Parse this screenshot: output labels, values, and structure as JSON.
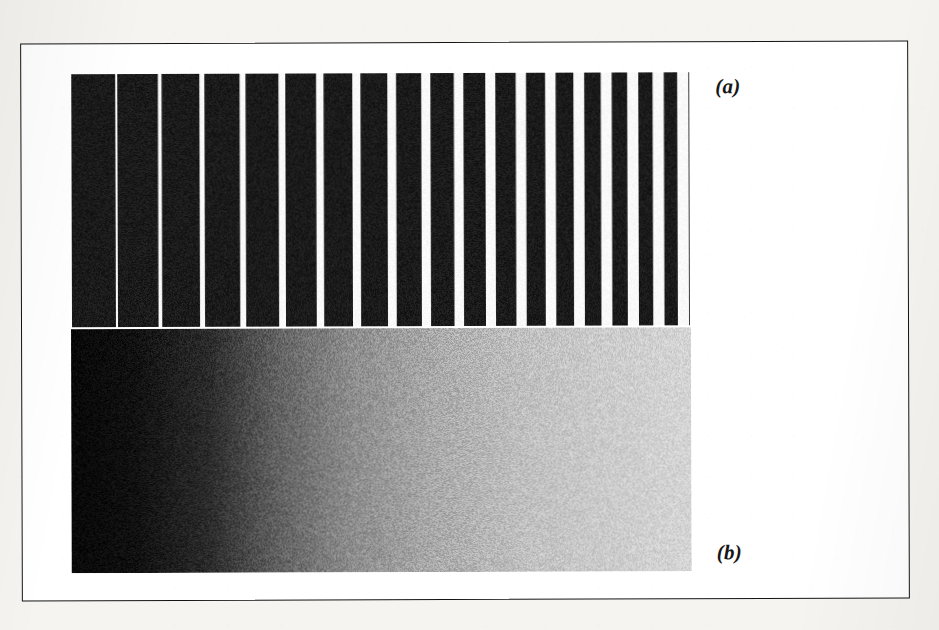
{
  "figure": {
    "caption_labels": {
      "panel_a": "(a)",
      "panel_b": "(b)"
    },
    "frame": {
      "border_color": "#141414",
      "background_color": "#ffffff",
      "page_background_color": "#f5f4f1"
    }
  },
  "chart_data": [
    {
      "id": "panel-a",
      "type": "bar",
      "title": "(a)",
      "subtitle": "Square-wave grating with spatial-frequency chirp",
      "xlabel": "",
      "ylabel": "",
      "grid": false,
      "legend": null,
      "description": "Vertical black bars on white whose spatial period decreases geometrically from left to right; bar duty cycle falls from near 1.0 (solid black) at the left to thin lines at the right.",
      "x_extent_px": [
        0,
        618
      ],
      "bar_color": "#0d0d0d",
      "gap_color": "#ffffff",
      "n_bars": 40,
      "period_start_px": 46.0,
      "period_end_px": 11.0,
      "duty_start": 0.955,
      "duty_end": 0.13,
      "categories": [
        "1",
        "2",
        "3",
        "4",
        "5",
        "6",
        "7",
        "8",
        "9",
        "10",
        "11",
        "12",
        "13",
        "14",
        "15",
        "16",
        "17",
        "18",
        "19",
        "20",
        "21",
        "22",
        "23",
        "24",
        "25",
        "26",
        "27",
        "28",
        "29",
        "30",
        "31",
        "32",
        "33",
        "34",
        "35",
        "36",
        "37",
        "38",
        "39",
        "40"
      ],
      "values": [
        1,
        1,
        1,
        1,
        1,
        1,
        1,
        1,
        1,
        1,
        1,
        1,
        1,
        1,
        1,
        1,
        1,
        1,
        1,
        1,
        1,
        1,
        1,
        1,
        1,
        1,
        1,
        1,
        1,
        1,
        1,
        1,
        1,
        1,
        1,
        1,
        1,
        1,
        1,
        1
      ],
      "ylim": [
        0,
        1
      ]
    },
    {
      "id": "panel-b",
      "type": "heatmap",
      "title": "(b)",
      "subtitle": "Noisy horizontal luminance ramp (dithered grey wedge)",
      "xlabel": "",
      "ylabel": "",
      "grid": false,
      "legend": null,
      "description": "Horizontal gradient ramping from black at the left edge to light grey at the right edge, overlaid with random halftone noise.",
      "gradient_stops": [
        {
          "position": 0.0,
          "value": 8,
          "hex": "#080808"
        },
        {
          "position": 0.1,
          "value": 16,
          "hex": "#101010"
        },
        {
          "position": 0.22,
          "value": 42,
          "hex": "#2a2a2a"
        },
        {
          "position": 0.33,
          "value": 96,
          "hex": "#606060"
        },
        {
          "position": 0.45,
          "value": 140,
          "hex": "#8c8c8c"
        },
        {
          "position": 0.58,
          "value": 168,
          "hex": "#a8a8a8"
        },
        {
          "position": 0.72,
          "value": 190,
          "hex": "#bebebe"
        },
        {
          "position": 0.86,
          "value": 203,
          "hex": "#cbcbcb"
        },
        {
          "position": 1.0,
          "value": 212,
          "hex": "#d4d4d4"
        }
      ],
      "noise_amplitude": 26,
      "xlim": [
        0,
        1
      ],
      "ylim": [
        0,
        1
      ]
    }
  ]
}
